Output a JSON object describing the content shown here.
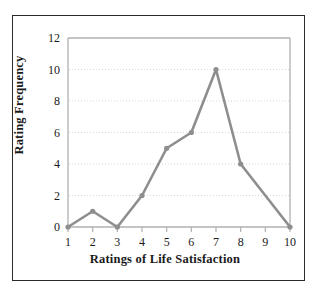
{
  "chart_data": {
    "type": "line",
    "title": "",
    "xlabel": "Ratings of Life Satisfaction",
    "ylabel": "Rating Frequency",
    "x": [
      1,
      2,
      3,
      4,
      5,
      6,
      7,
      8,
      9,
      10
    ],
    "values": [
      0,
      1,
      0,
      2,
      5,
      6,
      10,
      4,
      2,
      0
    ],
    "xticklabels": [
      "1",
      "2",
      "3",
      "4",
      "5",
      "6",
      "7",
      "8",
      "9",
      "10"
    ],
    "yticklabels": [
      "0",
      "2",
      "4",
      "6",
      "8",
      "10",
      "12"
    ],
    "yticks": [
      0,
      2,
      4,
      6,
      8,
      10,
      12
    ],
    "xlim": [
      1,
      10
    ],
    "ylim": [
      0,
      12
    ],
    "grid": "horizontal-dotted",
    "legend": "none",
    "marker_points": [
      1,
      2,
      3,
      4,
      5,
      6,
      7,
      8,
      10
    ],
    "line_color": "#8e8e8e",
    "marker_color": "#8e8e8e",
    "gridline_color": "#d8d8d8",
    "axis_color": "#b0b0b0",
    "frame_color": "#2b2b2b",
    "background_color": "#ffffff",
    "text_color": "#1a1a1a"
  }
}
